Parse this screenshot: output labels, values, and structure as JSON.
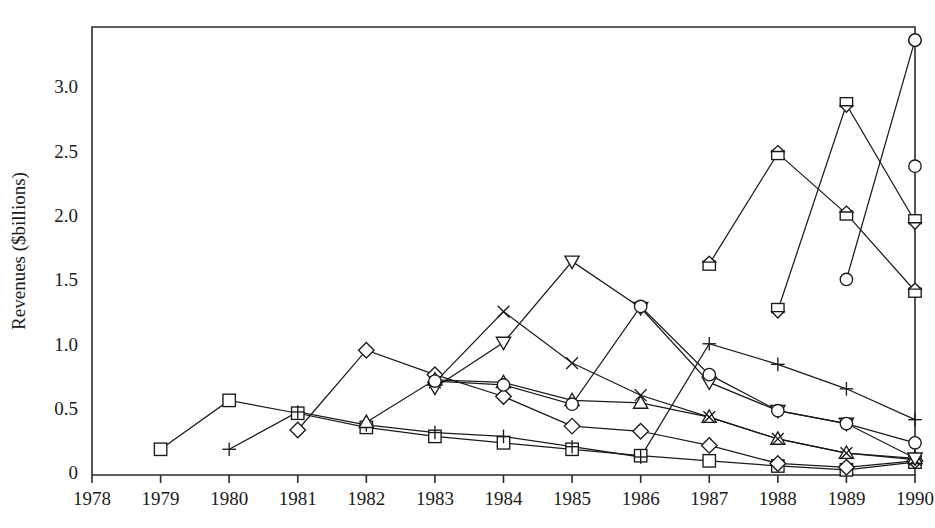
{
  "chart_data": {
    "type": "line",
    "title": "",
    "xlabel": "",
    "ylabel": "Revenues ($billions)",
    "xlim": [
      1978,
      1990
    ],
    "ylim": [
      0,
      3.45
    ],
    "grid": false,
    "legend": "none",
    "x": [
      1978,
      1979,
      1980,
      1981,
      1982,
      1983,
      1984,
      1985,
      1986,
      1987,
      1988,
      1989,
      1990
    ],
    "xticklabels": [
      "1978",
      "1979",
      "1980",
      "1981",
      "1982",
      "1983",
      "1984",
      "1985",
      "1986",
      "1987",
      "1988",
      "1989",
      "1990"
    ],
    "yticks": [
      0,
      0.5,
      1.0,
      1.5,
      2.0,
      2.5,
      3.0
    ],
    "yticklabels": [
      "0",
      "0.5",
      "1.0",
      "1.5",
      "2.0",
      "2.5",
      "3.0"
    ],
    "series": [
      {
        "name": "square",
        "marker": "square",
        "x": [
          1979,
          1980,
          1981,
          1982,
          1983,
          1984,
          1985,
          1986,
          1987,
          1988,
          1989,
          1990
        ],
        "values": [
          0.2,
          0.58,
          0.48,
          0.37,
          0.3,
          0.25,
          0.2,
          0.15,
          0.11,
          0.07,
          0.04,
          0.1
        ]
      },
      {
        "name": "plus",
        "marker": "plus",
        "x": [
          1980,
          1981,
          1982,
          1983,
          1984,
          1985,
          1986,
          1987,
          1988,
          1989,
          1990
        ],
        "values": [
          0.2,
          0.49,
          0.39,
          0.33,
          0.3,
          0.22,
          0.14,
          1.02,
          0.86,
          0.67,
          0.43
        ]
      },
      {
        "name": "diamond",
        "marker": "diamond",
        "x": [
          1981,
          1982,
          1983,
          1984,
          1985,
          1986,
          1987,
          1988,
          1989,
          1990
        ],
        "values": [
          0.35,
          0.97,
          0.78,
          0.61,
          0.38,
          0.34,
          0.23,
          0.09,
          0.06,
          0.11
        ]
      },
      {
        "name": "triangle-up",
        "marker": "triangle-up",
        "x": [
          1982,
          1983,
          1984,
          1985,
          1986,
          1987,
          1988,
          1989,
          1990
        ],
        "values": [
          0.41,
          0.74,
          0.72,
          0.58,
          0.56,
          0.45,
          0.28,
          0.17,
          0.13
        ]
      },
      {
        "name": "cross",
        "marker": "cross",
        "x": [
          1983,
          1984,
          1985,
          1986,
          1987,
          1988,
          1989,
          1990
        ],
        "values": [
          0.72,
          1.27,
          0.87,
          0.62,
          0.45,
          0.28,
          0.17,
          0.12
        ]
      },
      {
        "name": "triangle-down",
        "marker": "triangle-down",
        "x": [
          1983,
          1984,
          1985,
          1986,
          1987,
          1988,
          1989,
          1990
        ],
        "values": [
          0.68,
          1.03,
          1.66,
          1.3,
          0.72,
          0.5,
          0.4,
          0.13
        ]
      },
      {
        "name": "circle",
        "marker": "circle",
        "x": [
          1983,
          1984,
          1985,
          1986,
          1987,
          1988,
          1989,
          1990
        ],
        "values": [
          0.73,
          0.7,
          0.55,
          1.31,
          0.78,
          0.5,
          0.4,
          0.25
        ]
      },
      {
        "name": "square-triangle-up",
        "marker": "square-triangle-up",
        "x": [
          1987,
          1988,
          1989,
          1990
        ],
        "values": [
          1.64,
          2.5,
          2.03,
          1.43
        ]
      },
      {
        "name": "square-triangle-down",
        "marker": "square-triangle-down",
        "x": [
          1988,
          1989,
          1990
        ],
        "values": [
          1.28,
          2.88,
          1.97
        ]
      },
      {
        "name": "circle-high",
        "marker": "circle",
        "x": [
          1989,
          1990
        ],
        "values": [
          1.52,
          3.38
        ]
      },
      {
        "name": "circle-top",
        "marker": "circle",
        "x": [
          1990
        ],
        "values": [
          3.38
        ]
      },
      {
        "name": "circle-second",
        "marker": "circle",
        "x": [
          1990
        ],
        "values": [
          2.4
        ]
      }
    ]
  },
  "axes": {
    "y_title": "Revenues ($billions)"
  }
}
